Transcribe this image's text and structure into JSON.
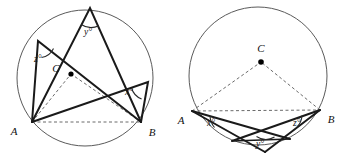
{
  "figure": {
    "background_color": "#ffffff",
    "stroke_color": "#1a1a1a",
    "circle_color": "#5a5a5a",
    "dash_color": "#6b6b6b"
  },
  "left_circle": {
    "name": "left-circle",
    "center_label": "C",
    "point_a_label": "A",
    "point_b_label": "B",
    "angles": [
      {
        "id": "z",
        "label": "z°"
      },
      {
        "id": "y",
        "label": "y°"
      },
      {
        "id": "x",
        "label": "x°"
      }
    ],
    "geometry": {
      "cx": 85,
      "cy": 78,
      "r": 68,
      "center_dot": [
        71,
        74
      ],
      "a": [
        32,
        122
      ],
      "b": [
        141,
        122
      ],
      "vertex_y": [
        90,
        8
      ],
      "vertex_z": [
        38,
        41
      ],
      "vertex_x": [
        148,
        82
      ]
    }
  },
  "right_circle": {
    "name": "right-circle",
    "center_label": "C",
    "point_a_label": "A",
    "point_b_label": "B",
    "angles": [
      {
        "id": "x",
        "label": "x°"
      },
      {
        "id": "y",
        "label": "y°"
      },
      {
        "id": "z",
        "label": "z°"
      }
    ],
    "geometry": {
      "cx": 258,
      "cy": 76,
      "r": 69,
      "center_dot": [
        261,
        62
      ],
      "a": [
        192,
        111
      ],
      "b": [
        320,
        110
      ],
      "vertex_y": [
        265,
        152
      ],
      "inner_left": [
        232,
        141
      ],
      "inner_right": [
        290,
        139
      ]
    }
  }
}
